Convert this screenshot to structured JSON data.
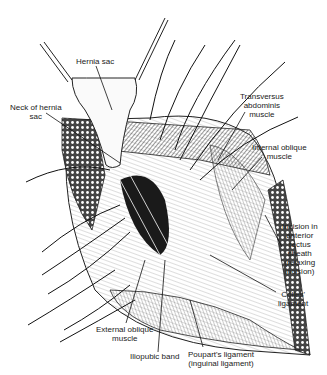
{
  "figure": {
    "type": "surgical anatomical illustration",
    "labels": [
      {
        "id": "hernia-sac",
        "lines": [
          "Hernia sac"
        ]
      },
      {
        "id": "neck-of-hernia-sac",
        "lines": [
          "Neck of hernia",
          "sac"
        ]
      },
      {
        "id": "transversus-abdominis",
        "lines": [
          "Transversus",
          "abdominis",
          "muscle"
        ]
      },
      {
        "id": "internal-oblique",
        "lines": [
          "Internal oblique",
          "muscle"
        ]
      },
      {
        "id": "incision-anterior-rectus",
        "lines": [
          "Incision in",
          "anterior",
          "rectus",
          "sheath",
          "(relaxing",
          "incision)"
        ]
      },
      {
        "id": "colles-ligament",
        "lines": [
          "Colles'",
          "ligament"
        ]
      },
      {
        "id": "external-oblique",
        "lines": [
          "External oblique",
          "muscle"
        ]
      },
      {
        "id": "iliopubic-band",
        "lines": [
          "Iliopubic band"
        ]
      },
      {
        "id": "pouparts-ligament",
        "lines": [
          "Poupart's ligament",
          "(inguinal ligament)"
        ]
      }
    ]
  }
}
